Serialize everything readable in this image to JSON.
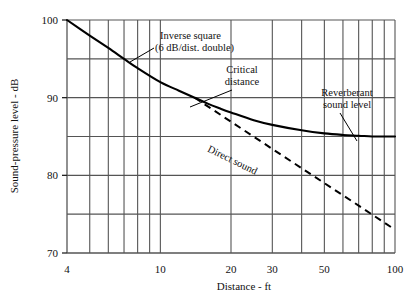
{
  "chart_data": {
    "type": "line",
    "title": "",
    "xlabel": "Distance - ft",
    "ylabel": "Sound-pressure level - dB",
    "xscale": "log",
    "xlim": [
      4,
      100
    ],
    "ylim": [
      70,
      100
    ],
    "grid": true,
    "legend_position": "none",
    "xticks_labeled": [
      "4",
      "10",
      "20",
      "30",
      "50",
      "100"
    ],
    "xtick_values": [
      4,
      10,
      20,
      30,
      50,
      100
    ],
    "xgrid_values": [
      4,
      5,
      6,
      7,
      8,
      9,
      10,
      20,
      30,
      40,
      50,
      60,
      70,
      80,
      90,
      100
    ],
    "yticks_labeled": [
      "70",
      "80",
      "90",
      "100"
    ],
    "ytick_values": [
      70,
      80,
      90,
      100
    ],
    "ygrid_values": [
      70,
      75,
      80,
      85,
      90,
      95,
      100
    ],
    "series": [
      {
        "name": "Reverberant sound level",
        "style": "solid",
        "color": "#000000",
        "points": [
          [
            4,
            100.0
          ],
          [
            5,
            98.0
          ],
          [
            6,
            96.4
          ],
          [
            7,
            95.0
          ],
          [
            8,
            93.8
          ],
          [
            10,
            92.0
          ],
          [
            12,
            90.9
          ],
          [
            14,
            90.0
          ],
          [
            16,
            89.2
          ],
          [
            18,
            88.6
          ],
          [
            20,
            88.1
          ],
          [
            25,
            87.1
          ],
          [
            30,
            86.5
          ],
          [
            40,
            85.8
          ],
          [
            50,
            85.4
          ],
          [
            60,
            85.2
          ],
          [
            70,
            85.1
          ],
          [
            80,
            85.0
          ],
          [
            90,
            85.0
          ],
          [
            100,
            85.0
          ]
        ]
      },
      {
        "name": "Direct sound",
        "style": "dashed",
        "color": "#000000",
        "points": [
          [
            14,
            90.0
          ],
          [
            20,
            86.9
          ],
          [
            30,
            83.4
          ],
          [
            50,
            79.0
          ],
          [
            70,
            76.1
          ],
          [
            100,
            73.0
          ]
        ]
      }
    ],
    "annotations": [
      {
        "id": "inverse-square",
        "text_line1": "Inverse square",
        "text_line2": "(6 dB/dist. double)",
        "points_to": [
          8.0,
          94.0
        ]
      },
      {
        "id": "critical-distance",
        "text_line1": "Critical",
        "text_line2": "distance",
        "points_to": [
          14.0,
          90.0
        ]
      },
      {
        "id": "reverberant-sound-level",
        "text_line1": "Reverberant",
        "text_line2": "sound level",
        "points_to": [
          62.0,
          85.2
        ]
      },
      {
        "id": "direct-sound",
        "text_line1": "Direct sound",
        "rotated": true
      }
    ]
  },
  "caption": {
    "text": ""
  }
}
